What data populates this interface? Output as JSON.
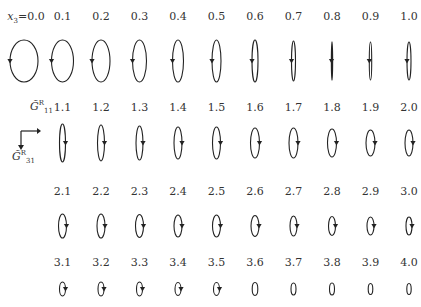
{
  "figure": {
    "variable_label": "x",
    "variable_subscript": "3",
    "first_value_prefix": "=0.0",
    "axes_legend": {
      "horizontal_label": "G̃",
      "horizontal_superscript": "R",
      "horizontal_subscript": "11",
      "vertical_label": "G̃",
      "vertical_superscript": "R",
      "vertical_subscript": "31"
    },
    "rows": [
      {
        "labels": [
          "0.0",
          "0.1",
          "0.2",
          "0.3",
          "0.4",
          "0.5",
          "0.6",
          "0.7",
          "0.8",
          "0.9",
          "1.0"
        ],
        "rx": [
          14,
          11,
          9,
          7,
          5.5,
          4.5,
          3,
          2,
          0.5,
          1.2,
          2
        ],
        "ry": [
          21,
          21,
          21,
          21,
          21,
          21,
          21,
          20,
          19,
          19,
          19
        ],
        "arrow_side": [
          "left",
          "left",
          "left",
          "left",
          "left",
          "left",
          "left",
          "left",
          "left",
          "left",
          "left"
        ]
      },
      {
        "labels": [
          "1.1",
          "1.2",
          "1.3",
          "1.4",
          "1.5",
          "1.6",
          "1.7",
          "1.8",
          "1.9",
          "2.0"
        ],
        "rx": [
          3,
          3.5,
          3.5,
          4,
          4,
          4.5,
          4.5,
          4.5,
          4.5,
          4
        ],
        "ry": [
          19,
          18,
          17,
          16,
          16,
          15,
          15,
          14,
          13,
          13
        ],
        "arrow_side": [
          "right",
          "right",
          "right",
          "right",
          "right",
          "right",
          "right",
          "right",
          "right",
          "right"
        ]
      },
      {
        "labels": [
          "2.1",
          "2.2",
          "2.3",
          "2.4",
          "2.5",
          "2.6",
          "2.7",
          "2.8",
          "2.9",
          "3.0"
        ],
        "rx": [
          4,
          4,
          4,
          4,
          4,
          4,
          3.5,
          3.5,
          3.5,
          3
        ],
        "ry": [
          12,
          12,
          11.5,
          11,
          11,
          10.5,
          10,
          9.5,
          9,
          9
        ],
        "arrow_side": [
          "right",
          "right",
          "right",
          "right",
          "right",
          "right",
          "right",
          "right",
          "right",
          "right"
        ]
      },
      {
        "labels": [
          "3.1",
          "3.2",
          "3.3",
          "3.4",
          "3.5",
          "3.6",
          "3.7",
          "3.8",
          "3.9",
          "4.0"
        ],
        "rx": [
          3,
          3,
          3,
          3,
          3,
          2.8,
          2.5,
          2.5,
          2.3,
          2.2
        ],
        "ry": [
          7,
          7,
          7,
          6.5,
          6.5,
          6.5,
          6,
          6,
          5.5,
          5.5
        ],
        "arrow_side": [
          "right",
          "right",
          "right",
          "right",
          "right",
          "none",
          "none",
          "none",
          "none",
          "none"
        ]
      }
    ]
  },
  "chart_data": {
    "type": "diagram",
    "title": "",
    "parameter": "x3",
    "values": [
      "0.0",
      "0.1",
      "0.2",
      "0.3",
      "0.4",
      "0.5",
      "0.6",
      "0.7",
      "0.8",
      "0.9",
      "1.0",
      "1.1",
      "1.2",
      "1.3",
      "1.4",
      "1.5",
      "1.6",
      "1.7",
      "1.8",
      "1.9",
      "2.0",
      "2.1",
      "2.2",
      "2.3",
      "2.4",
      "2.5",
      "2.6",
      "2.7",
      "2.8",
      "2.9",
      "3.0",
      "3.1",
      "3.2",
      "3.3",
      "3.4",
      "3.5",
      "3.6",
      "3.7",
      "3.8",
      "3.9",
      "4.0"
    ],
    "axes": {
      "horizontal": "G̃R11",
      "vertical": "G̃R31"
    }
  },
  "style": {
    "stroke": "#222222",
    "label_color": "#333333",
    "background": "#ffffff"
  }
}
